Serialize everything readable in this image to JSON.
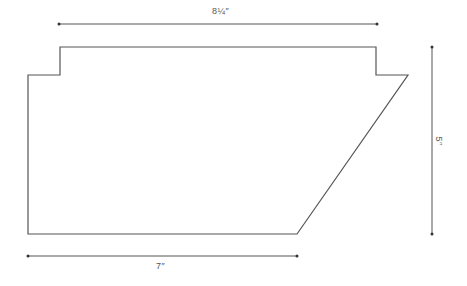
{
  "diagram": {
    "type": "dimensioned-shape",
    "stroke_color": "#555555",
    "shape": {
      "name": "panel-outline",
      "points": [
        [
          60,
          47
        ],
        [
          376,
          47
        ],
        [
          376,
          75
        ],
        [
          408,
          75
        ],
        [
          297,
          234
        ],
        [
          28,
          234
        ],
        [
          28,
          75
        ],
        [
          60,
          75
        ]
      ]
    },
    "dimensions": {
      "top": {
        "label": "8¼″",
        "x1": 59,
        "y1": 24,
        "x2": 377,
        "y2": 24
      },
      "bottom": {
        "label": "7″",
        "x1": 28,
        "y1": 256,
        "x2": 297,
        "y2": 256
      },
      "right": {
        "label": "5″",
        "x1": 432,
        "y1": 47,
        "x2": 432,
        "y2": 234
      }
    }
  }
}
